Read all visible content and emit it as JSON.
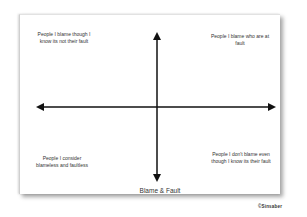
{
  "diagram": {
    "x_axis": {
      "label": "Blame & Fault"
    },
    "quadrants": {
      "top_left": "People I blame though I know its not their fault",
      "top_right": "People I blame who are at fault",
      "bottom_left": "People I consider blameless and faultless",
      "bottom_right": "People I don't blame even though I know its their fault"
    },
    "watermark": "©Sinsaber",
    "colors": {
      "axis": "#111111",
      "paper": "#ffffff",
      "text": "#333333"
    }
  }
}
